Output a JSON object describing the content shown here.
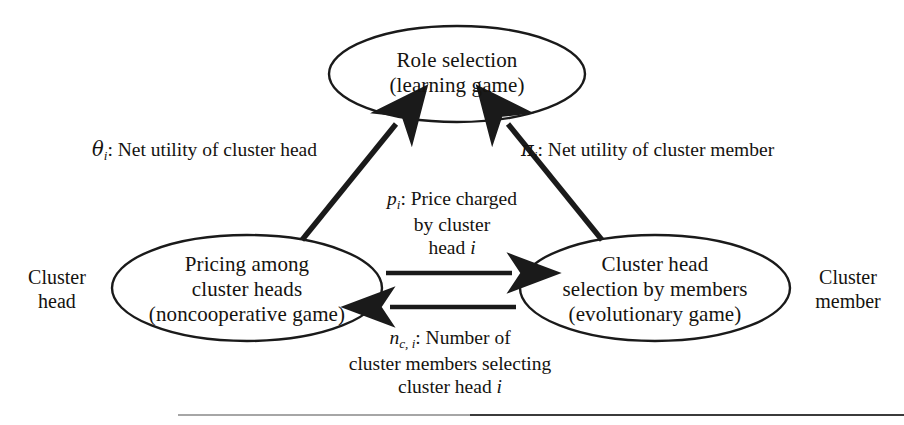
{
  "diagram": {
    "nodes": [
      {
        "id": "role-selection",
        "lines": [
          "Role selection",
          "(learning game)"
        ]
      },
      {
        "id": "pricing-among-cluster-heads",
        "lines": [
          "Pricing among",
          "cluster heads",
          "(noncooperative game)"
        ]
      },
      {
        "id": "cluster-head-selection",
        "lines": [
          "Cluster head",
          "selection by members",
          "(evolutionary game)"
        ]
      }
    ],
    "edge_labels": {
      "theta": {
        "symbol": "θ",
        "subscript": "i",
        "text": ": Net utility of cluster head"
      },
      "pi": {
        "symbol": "π",
        "subscript": "i",
        "text": ": Net utility of cluster member"
      },
      "price": {
        "symbol": "p",
        "subscript": "i",
        "line1": ": Price charged",
        "line2": "by  cluster",
        "line3_prefix": "head ",
        "line3_italic": "i"
      },
      "members": {
        "symbol": "n",
        "subscript": "c, i",
        "line1": ": Number of",
        "line2": "cluster members selecting",
        "line3_prefix": "cluster head ",
        "line3_italic": "i"
      }
    },
    "side_labels": {
      "left": [
        "Cluster",
        "head"
      ],
      "right": [
        "Cluster",
        "member"
      ]
    },
    "colors": {
      "stroke": "#1a1a1a",
      "text": "#15130f",
      "background": "#ffffff",
      "footer_rule": "#2b2b2b"
    }
  }
}
